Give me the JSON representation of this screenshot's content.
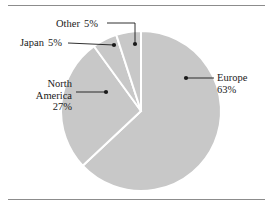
{
  "chart_data": {
    "type": "pie",
    "title": "",
    "categories": [
      "Europe",
      "North America",
      "Japan",
      "Other"
    ],
    "values": [
      63,
      27,
      5,
      5
    ],
    "value_unit": "%",
    "legend": "none",
    "labels_inline": true,
    "slice_fill": "#c8c8c8",
    "slice_separator": "#ffffff",
    "start_angle_deg": -90,
    "direction": "clockwise",
    "slices": [
      {
        "name": "Europe",
        "value": 63,
        "label_text": "Europe",
        "value_text": "63%"
      },
      {
        "name": "North America",
        "value": 27,
        "label_line1": "North",
        "label_line2": "America",
        "value_text": "27%"
      },
      {
        "name": "Japan",
        "value": 5,
        "label_text": "Japan",
        "value_text": "5%"
      },
      {
        "name": "Other",
        "value": 5,
        "label_text": "Other",
        "value_text": "5%"
      }
    ]
  },
  "labels": {
    "other": {
      "name": "Other",
      "pct": "5%"
    },
    "japan": {
      "name": "Japan",
      "pct": "5%"
    },
    "north_america": {
      "line1": "North",
      "line2": "America",
      "pct": "27%"
    },
    "europe": {
      "name": "Europe",
      "pct": "63%"
    }
  },
  "style": {
    "fill": "#c8c8c8",
    "separator": "#ffffff",
    "rule_color": "#8c8c8c",
    "leader_color": "#1a1a1a",
    "text_color": "#1a1a1a",
    "background": "#ffffff"
  }
}
